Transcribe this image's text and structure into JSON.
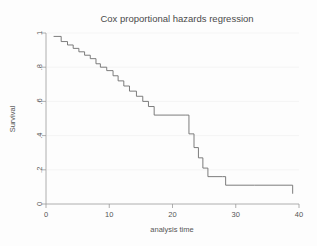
{
  "chart_data": {
    "type": "line",
    "title": "Cox proportional hazards regression",
    "xlabel": "analysis time",
    "ylabel": "Survival",
    "xlim": [
      0,
      40
    ],
    "ylim": [
      0,
      1
    ],
    "grid": false,
    "legend": null,
    "xticks": [
      "0",
      "10",
      "20",
      "30",
      "40"
    ],
    "xtick_values": [
      0,
      10,
      20,
      30,
      40
    ],
    "yticks": [
      "0",
      ".2",
      ".4",
      ".6",
      ".8",
      "1"
    ],
    "ytick_values": [
      0,
      0.2,
      0.4,
      0.6,
      0.8,
      1
    ],
    "series": [
      {
        "name": "Survival",
        "step": "post",
        "x": [
          1.2,
          2.4,
          3.4,
          4.3,
          5.2,
          6.1,
          7.0,
          7.9,
          8.6,
          9.6,
          10.6,
          11.4,
          12.3,
          13.2,
          14.3,
          15.3,
          16.2,
          17.1,
          22.0,
          22.6,
          23.4,
          24.1,
          24.8,
          25.6,
          27.9,
          28.4,
          33.0,
          39.0
        ],
        "y": [
          0.98,
          0.95,
          0.93,
          0.91,
          0.89,
          0.87,
          0.85,
          0.82,
          0.8,
          0.78,
          0.75,
          0.72,
          0.69,
          0.66,
          0.63,
          0.6,
          0.57,
          0.52,
          0.52,
          0.41,
          0.33,
          0.27,
          0.21,
          0.16,
          0.16,
          0.11,
          0.11,
          0.06
        ]
      }
    ]
  }
}
